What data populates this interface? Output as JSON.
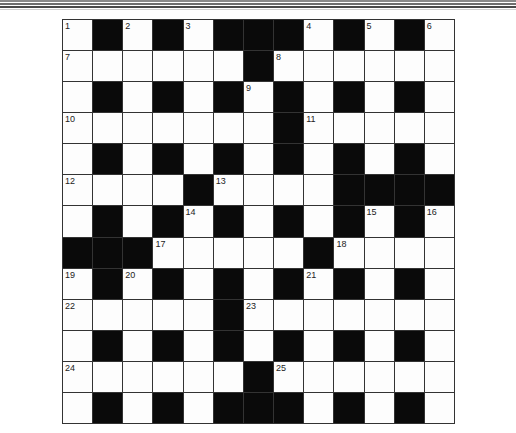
{
  "puzzle": {
    "type": "crossword",
    "rows": 13,
    "cols": 13,
    "layout": [
      "W.W.W...W.W.W",
      "WWWWWW.WWWWWW",
      "W.W.W.W.W.W.W",
      "WWWWWWW.WWWWW",
      "W.W.W.W.W.W.W",
      "WWWW.WWWW....",
      "W.W.W.W.W.W.W",
      "...WWWWW.WWWW",
      "W.W.W.W.W.W.W",
      "WWWWW.WWWWWWW",
      "W.W.W.W.W.W.W",
      "WWWWWW.WWWWWW",
      "W.W.W...W.W.W"
    ],
    "numbers": [
      {
        "row": 0,
        "col": 0,
        "n": "1"
      },
      {
        "row": 0,
        "col": 2,
        "n": "2"
      },
      {
        "row": 0,
        "col": 4,
        "n": "3"
      },
      {
        "row": 0,
        "col": 8,
        "n": "4"
      },
      {
        "row": 0,
        "col": 10,
        "n": "5"
      },
      {
        "row": 0,
        "col": 12,
        "n": "6"
      },
      {
        "row": 1,
        "col": 0,
        "n": "7"
      },
      {
        "row": 1,
        "col": 7,
        "n": "8"
      },
      {
        "row": 2,
        "col": 6,
        "n": "9"
      },
      {
        "row": 3,
        "col": 0,
        "n": "10"
      },
      {
        "row": 3,
        "col": 8,
        "n": "11"
      },
      {
        "row": 5,
        "col": 0,
        "n": "12"
      },
      {
        "row": 5,
        "col": 5,
        "n": "13"
      },
      {
        "row": 6,
        "col": 4,
        "n": "14"
      },
      {
        "row": 6,
        "col": 10,
        "n": "15"
      },
      {
        "row": 6,
        "col": 12,
        "n": "16"
      },
      {
        "row": 7,
        "col": 3,
        "n": "17"
      },
      {
        "row": 7,
        "col": 9,
        "n": "18"
      },
      {
        "row": 8,
        "col": 0,
        "n": "19"
      },
      {
        "row": 8,
        "col": 2,
        "n": "20"
      },
      {
        "row": 8,
        "col": 8,
        "n": "21"
      },
      {
        "row": 9,
        "col": 0,
        "n": "22"
      },
      {
        "row": 9,
        "col": 6,
        "n": "23"
      },
      {
        "row": 11,
        "col": 0,
        "n": "24"
      },
      {
        "row": 11,
        "col": 7,
        "n": "25"
      }
    ]
  },
  "colors": {
    "black_square": "#0a0a0a",
    "white_square": "#fdfdfd",
    "grid_line": "#333333"
  }
}
